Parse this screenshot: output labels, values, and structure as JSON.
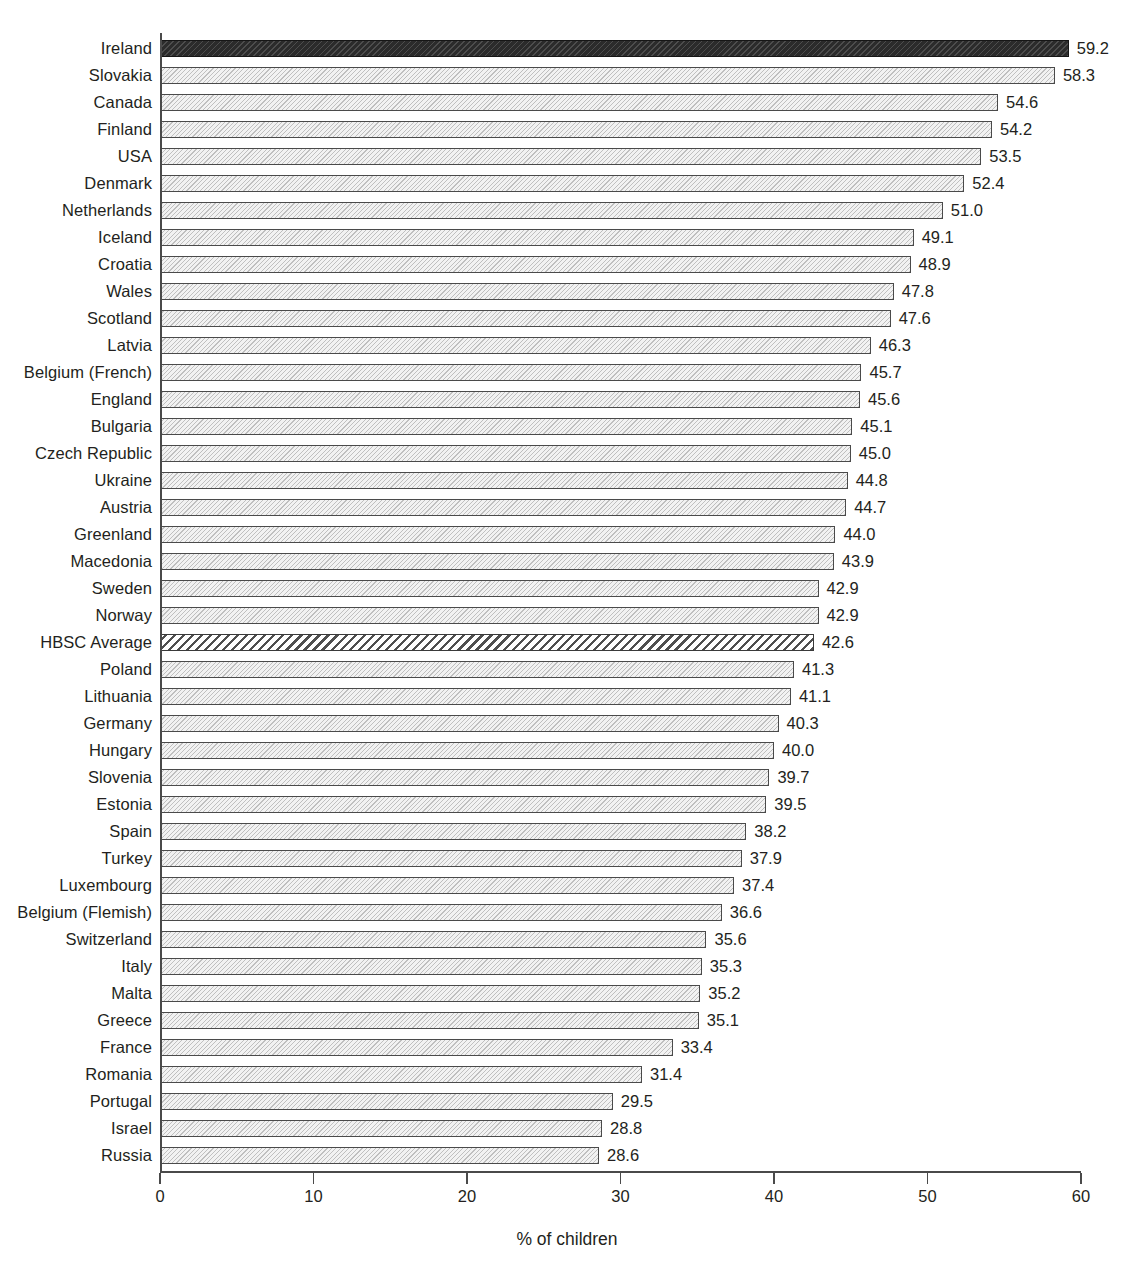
{
  "chart_data": {
    "type": "bar",
    "orientation": "horizontal",
    "title": "",
    "xlabel": "% of children",
    "ylabel": "",
    "xlim": [
      0,
      60
    ],
    "xticks": [
      "0",
      "10",
      "20",
      "30",
      "40",
      "50",
      "60"
    ],
    "xtick_values": [
      0,
      10,
      20,
      30,
      40,
      50,
      60
    ],
    "grid": false,
    "legend": null,
    "value_label_format": "one-decimal",
    "highlight_category": "Ireland",
    "average_category": "HBSC Average",
    "colors": {
      "bar_fill": "#f2f2f2",
      "bar_border": "#4a4a4a",
      "highlight_fill": "#2b2b2b",
      "average_hatch": "#4f4f4f",
      "text": "#231f20",
      "background": "#ffffff"
    },
    "categories": [
      "Ireland",
      "Slovakia",
      "Canada",
      "Finland",
      "USA",
      "Denmark",
      "Netherlands",
      "Iceland",
      "Croatia",
      "Wales",
      "Scotland",
      "Latvia",
      "Belgium (French)",
      "England",
      "Bulgaria",
      "Czech Republic",
      "Ukraine",
      "Austria",
      "Greenland",
      "Macedonia",
      "Sweden",
      "Norway",
      "HBSC Average",
      "Poland",
      "Lithuania",
      "Germany",
      "Hungary",
      "Slovenia",
      "Estonia",
      "Spain",
      "Turkey",
      "Luxembourg",
      "Belgium (Flemish)",
      "Switzerland",
      "Italy",
      "Malta",
      "Greece",
      "France",
      "Romania",
      "Portugal",
      "Israel",
      "Russia"
    ],
    "values": [
      59.2,
      58.3,
      54.6,
      54.2,
      53.5,
      52.4,
      51.0,
      49.1,
      48.9,
      47.8,
      47.6,
      46.3,
      45.7,
      45.6,
      45.1,
      45.0,
      44.8,
      44.7,
      44.0,
      43.9,
      42.9,
      42.9,
      42.6,
      41.3,
      41.1,
      40.3,
      40.0,
      39.7,
      39.5,
      38.2,
      37.9,
      37.4,
      36.6,
      35.6,
      35.3,
      35.2,
      35.1,
      33.4,
      31.4,
      29.5,
      28.8,
      28.6
    ],
    "value_labels": [
      "59.2",
      "58.3",
      "54.6",
      "54.2",
      "53.5",
      "52.4",
      "51.0",
      "49.1",
      "48.9",
      "47.8",
      "47.6",
      "46.3",
      "45.7",
      "45.6",
      "45.1",
      "45.0",
      "44.8",
      "44.7",
      "44.0",
      "43.9",
      "42.9",
      "42.9",
      "42.6",
      "41.3",
      "41.1",
      "40.3",
      "40.0",
      "39.7",
      "39.5",
      "38.2",
      "37.9",
      "37.4",
      "36.6",
      "35.6",
      "35.3",
      "35.2",
      "35.1",
      "33.4",
      "31.4",
      "29.5",
      "28.8",
      "28.6"
    ]
  },
  "axis": {
    "x_title": "% of children",
    "tick_labels": [
      "0",
      "10",
      "20",
      "30",
      "40",
      "50",
      "60"
    ]
  },
  "top_clip": {
    "text": ""
  }
}
